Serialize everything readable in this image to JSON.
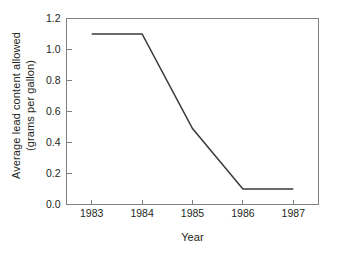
{
  "chart_data": {
    "type": "line",
    "title": "",
    "xlabel": "Year",
    "ylabel": "Average lead content allowed (grams per gallon)",
    "ylabel_line1": "Average lead content allowed",
    "ylabel_line2": "(grams per gallon)",
    "x": [
      1983,
      1984,
      1985,
      1986,
      1987
    ],
    "categories": [
      "1983",
      "1984",
      "1985",
      "1986",
      "1987"
    ],
    "values": [
      1.1,
      1.1,
      0.49,
      0.1,
      0.1
    ],
    "series": [
      {
        "name": "Average lead content allowed",
        "values": [
          1.1,
          1.1,
          0.49,
          0.1,
          0.1
        ]
      }
    ],
    "xlim": [
      1982.5,
      1987.5
    ],
    "ylim": [
      0.0,
      1.2
    ],
    "ytick_labels": [
      "0.0",
      "0.2",
      "0.4",
      "0.6",
      "0.8",
      "1.0",
      "1.2"
    ],
    "ytick_values": [
      0.0,
      0.2,
      0.4,
      0.6,
      0.8,
      1.0,
      1.2
    ],
    "xtick_labels": [
      "1983",
      "1984",
      "1985",
      "1986",
      "1987"
    ],
    "grid": false,
    "legend": false,
    "legend_position": "none",
    "line_color": "#3a3a3a",
    "axis_color": "#808080",
    "background_color": "#ffffff"
  }
}
